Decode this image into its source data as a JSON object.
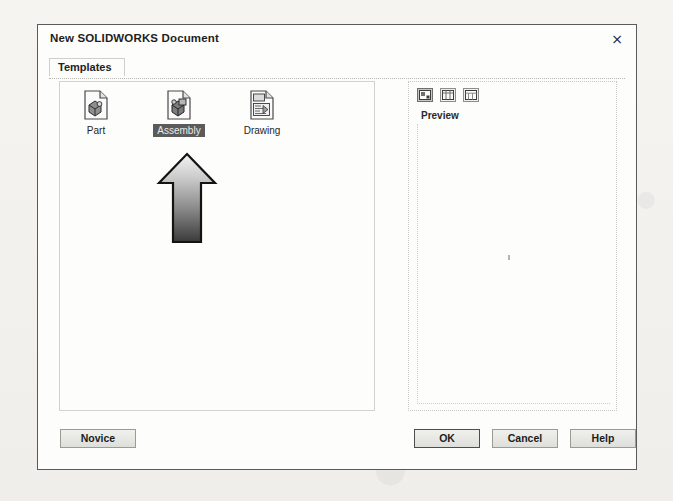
{
  "dialog": {
    "title": "New SOLIDWORKS Document",
    "close_icon": "close-icon",
    "close_glyph": "×"
  },
  "tabs": [
    {
      "label": "Templates",
      "active": true
    }
  ],
  "templates": {
    "items": [
      {
        "label": "Part",
        "icon": "part-document-icon",
        "selected": false
      },
      {
        "label": "Assembly",
        "icon": "assembly-document-icon",
        "selected": true
      },
      {
        "label": "Drawing",
        "icon": "drawing-document-icon",
        "selected": false
      }
    ]
  },
  "preview": {
    "label": "Preview",
    "content": "",
    "view_buttons": [
      {
        "name": "large-icons-view-button",
        "icon": "large-icons-icon",
        "active": true
      },
      {
        "name": "list-view-button",
        "icon": "list-view-icon",
        "active": false
      },
      {
        "name": "details-view-button",
        "icon": "details-view-icon",
        "active": false
      }
    ]
  },
  "buttons": {
    "novice": "Novice",
    "ok": "OK",
    "cancel": "Cancel",
    "help": "Help"
  },
  "annotation": {
    "arrow": "up-arrow-annotation",
    "points_to": "Assembly"
  },
  "colors": {
    "dialog_bg": "#fdfdfc",
    "dialog_border": "#5a5a5a",
    "selection_bg": "#5b5b5b",
    "selection_fg": "#e9e9e9",
    "button_face": "#e4e4e0",
    "default_button_border": "#4d4d4d",
    "page_bg": "#f3f2ef"
  }
}
